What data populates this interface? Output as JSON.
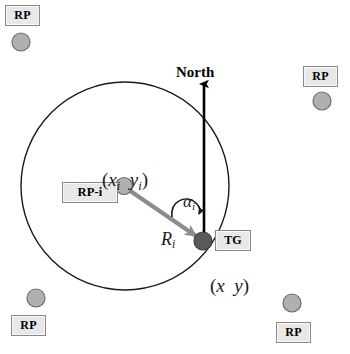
{
  "figure": {
    "title_label": "North",
    "colors": {
      "circle_stroke": "#1a1a1a",
      "north_arrow": "#000000",
      "vector_arrow": "#8c8c8c",
      "rp_marker_fill": "#b0b0b0",
      "rp_marker_stroke": "#6e6e6e",
      "tg_marker_fill": "#5a5a5a",
      "tg_marker_stroke": "#3c3c3c",
      "box_fill": "#e8e8e8",
      "box_border": "#8a8a8a",
      "text": "#000000"
    },
    "geometry": {
      "circle_center_x": 125,
      "circle_center_y": 186,
      "circle_radius": 104,
      "rp_i_point_x": 124,
      "rp_i_point_y": 186,
      "target_point_x": 203,
      "target_point_y": 241,
      "north_line_x": 204,
      "north_line_top_y": 80,
      "north_line_bottom_y": 243
    }
  },
  "labels": {
    "north": "North",
    "rp_i_box": "RP-i",
    "tg_box": "TG",
    "rp_box": "RP",
    "rp_i_coords": {
      "open": "(",
      "x": "x",
      "x_sub": "i",
      "gap": "  ",
      "y": "y",
      "y_sub": "i",
      "close": ")"
    },
    "target_coords": {
      "open": "(",
      "x": "x",
      "gap": "  ",
      "y": "y",
      "close": ")"
    },
    "range": {
      "symbol": "R",
      "sub": "i"
    },
    "angle": {
      "symbol": "α",
      "sub": "i"
    }
  },
  "reference_points": [
    {
      "id": "rp-top-left",
      "label": "RP",
      "box_x": 5,
      "box_y": 5,
      "marker_x": 21,
      "marker_y": 42,
      "order": "box-above"
    },
    {
      "id": "rp-top-right",
      "label": "RP",
      "box_x": 303,
      "box_y": 66,
      "marker_x": 322,
      "marker_y": 101,
      "order": "box-above"
    },
    {
      "id": "rp-bottom-left",
      "label": "RP",
      "box_x": 11,
      "box_y": 315,
      "marker_x": 36,
      "marker_y": 298,
      "order": "box-below"
    },
    {
      "id": "rp-bottom-right",
      "label": "RP",
      "box_x": 276,
      "box_y": 322,
      "marker_x": 292,
      "marker_y": 303,
      "order": "box-below"
    }
  ]
}
